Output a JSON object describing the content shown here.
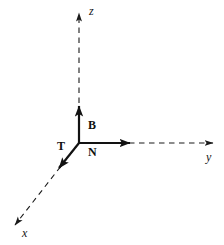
{
  "figure": {
    "width": 224,
    "height": 245,
    "background_color": "#ffffff",
    "stroke_color": "#1a1a1a",
    "origin": {
      "x": 79,
      "y": 143
    }
  },
  "axes": [
    {
      "name": "z",
      "label": "z",
      "style": "dashed",
      "label_style": "italic",
      "from": {
        "x": 79,
        "y": 143
      },
      "to": {
        "x": 79,
        "y": 12
      },
      "arrow": true
    },
    {
      "name": "y",
      "label": "y",
      "style": "dashed",
      "label_style": "italic",
      "from": {
        "x": 79,
        "y": 143
      },
      "to": {
        "x": 214,
        "y": 143
      },
      "arrow": true
    },
    {
      "name": "x",
      "label": "x",
      "style": "dashed",
      "label_style": "italic",
      "from": {
        "x": 79,
        "y": 143
      },
      "to": {
        "x": 14,
        "y": 226
      },
      "arrow": true
    }
  ],
  "vectors": [
    {
      "name": "B",
      "label": "B",
      "description": "binormal vector",
      "style": "solid-bold",
      "from": {
        "x": 79,
        "y": 143
      },
      "to": {
        "x": 79,
        "y": 103
      },
      "arrow": true
    },
    {
      "name": "N",
      "label": "N",
      "description": "normal vector",
      "style": "solid-bold",
      "from": {
        "x": 79,
        "y": 143
      },
      "to": {
        "x": 134,
        "y": 143
      },
      "arrow": true
    },
    {
      "name": "T",
      "label": "T",
      "description": "tangent vector",
      "style": "solid-bold",
      "from": {
        "x": 79,
        "y": 143
      },
      "to": {
        "x": 56,
        "y": 172
      },
      "arrow": true
    }
  ],
  "labels": {
    "z": "z",
    "y": "y",
    "x": "x",
    "B": "B",
    "N": "N",
    "T": "T"
  }
}
